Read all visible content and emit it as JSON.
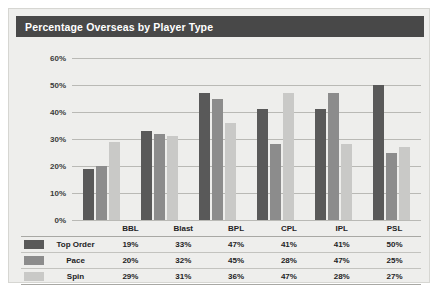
{
  "chart_data": {
    "type": "bar",
    "title": "Percentage Overseas by Player Type",
    "xlabel": "",
    "ylabel": "",
    "ylim": [
      0,
      60
    ],
    "ytick_labels": [
      "0%",
      "10%",
      "20%",
      "30%",
      "40%",
      "50%",
      "60%"
    ],
    "ytick_values": [
      0,
      10,
      20,
      30,
      40,
      50,
      60
    ],
    "grid": true,
    "legend_position": "bottom-table",
    "categories": [
      "BBL",
      "Blast",
      "BPL",
      "CPL",
      "IPL",
      "PSL"
    ],
    "series": [
      {
        "name": "Top Order",
        "color": "#595959",
        "values": [
          19,
          33,
          47,
          41,
          41,
          50
        ],
        "labels": [
          "19%",
          "33%",
          "47%",
          "41%",
          "41%",
          "50%"
        ]
      },
      {
        "name": "Pace",
        "color": "#8c8c8c",
        "values": [
          20,
          32,
          45,
          28,
          47,
          25
        ],
        "labels": [
          "20%",
          "32%",
          "45%",
          "28%",
          "47%",
          "25%"
        ]
      },
      {
        "name": "Spin",
        "color": "#c9c9c7",
        "values": [
          29,
          31,
          36,
          47,
          28,
          27
        ],
        "labels": [
          "29%",
          "31%",
          "36%",
          "47%",
          "28%",
          "27%"
        ]
      }
    ]
  },
  "card": {
    "title": "Percentage Overseas by Player Type"
  },
  "table": {
    "corner_header": "",
    "series_header": ""
  }
}
